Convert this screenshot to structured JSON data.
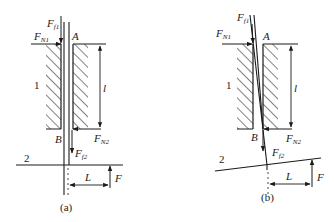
{
  "figure": {
    "colors": {
      "ink": "#1a1a1a",
      "background": "#ffffff"
    },
    "panels": [
      {
        "caption": "(a)",
        "labels": {
          "ff1": "F",
          "ff1_sub": "f1",
          "fn1": "F",
          "fn1_sub": "N1",
          "point_a": "A",
          "point_b": "B",
          "part_1": "1",
          "length_l": "l",
          "fn2": "F",
          "fn2_sub": "N2",
          "ff2": "F",
          "ff2_sub": "f2",
          "part_2": "2",
          "length_L": "L",
          "force_f": "F"
        },
        "rod": "vertical"
      },
      {
        "caption": "(b)",
        "labels": {
          "ff1": "F",
          "ff1_sub": "f1",
          "fn1": "F",
          "fn1_sub": "N1",
          "point_a": "A",
          "point_b": "B",
          "part_1": "1",
          "length_l": "l",
          "fn2": "F",
          "fn2_sub": "N2",
          "ff2": "F",
          "ff2_sub": "f2",
          "part_2": "2",
          "length_L": "L",
          "force_f": "F"
        },
        "rod": "tilted"
      }
    ]
  }
}
